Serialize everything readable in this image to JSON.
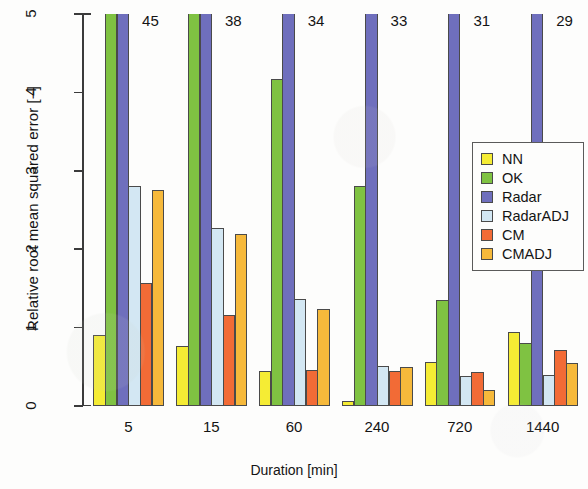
{
  "chart_data": {
    "type": "bar",
    "title": "",
    "xlabel": "Duration [min]",
    "ylabel": "Relative root mean squared error [−]",
    "categories": [
      "5",
      "15",
      "60",
      "240",
      "720",
      "1440"
    ],
    "ylim": [
      0,
      5
    ],
    "yticks": [
      0,
      1,
      2,
      3,
      4,
      5
    ],
    "ytick_labels": [
      "0",
      "1",
      "2",
      "3",
      "4",
      "5"
    ],
    "grid": false,
    "legend_position": "center right",
    "series": [
      {
        "name": "NN",
        "color": "#f5ec34",
        "values": [
          0.9,
          0.76,
          0.45,
          0.07,
          0.56,
          0.95
        ]
      },
      {
        "name": "OK",
        "color": "#7fc242",
        "values": [
          11.5,
          9.8,
          4.17,
          2.8,
          1.35,
          0.8
        ],
        "clipped": [
          true,
          true,
          false,
          false,
          false,
          false
        ]
      },
      {
        "name": "Radar",
        "color": "#6f6fbd",
        "values": [
          45,
          38,
          34,
          33,
          31,
          29
        ],
        "clipped": [
          true,
          true,
          true,
          true,
          true,
          true
        ],
        "clipped_labels": [
          "45",
          "38",
          "34",
          "33",
          "31",
          "29"
        ]
      },
      {
        "name": "RadarADJ",
        "color": "#d3e7f3",
        "values": [
          2.8,
          2.27,
          1.36,
          0.51,
          0.38,
          0.4
        ]
      },
      {
        "name": "CM",
        "color": "#f26b36",
        "values": [
          1.57,
          1.16,
          0.46,
          0.45,
          0.44,
          0.72
        ]
      },
      {
        "name": "CMADJ",
        "color": "#f6b93b",
        "values": [
          2.76,
          2.2,
          1.24,
          0.5,
          0.21,
          0.55
        ]
      }
    ],
    "annotations": [
      {
        "text": "45",
        "category": "5",
        "series": "Radar"
      },
      {
        "text": "38",
        "category": "15",
        "series": "Radar"
      },
      {
        "text": "34",
        "category": "60",
        "series": "Radar"
      },
      {
        "text": "33",
        "category": "240",
        "series": "Radar"
      },
      {
        "text": "31",
        "category": "720",
        "series": "Radar"
      },
      {
        "text": "29",
        "category": "1440",
        "series": "Radar"
      }
    ]
  },
  "legend": {
    "entries": [
      {
        "label": "NN",
        "color": "#f5ec34"
      },
      {
        "label": "OK",
        "color": "#7fc242"
      },
      {
        "label": "Radar",
        "color": "#6f6fbd"
      },
      {
        "label": "RadarADJ",
        "color": "#d3e7f3"
      },
      {
        "label": "CM",
        "color": "#f26b36"
      },
      {
        "label": "CMADJ",
        "color": "#f6b93b"
      }
    ]
  }
}
